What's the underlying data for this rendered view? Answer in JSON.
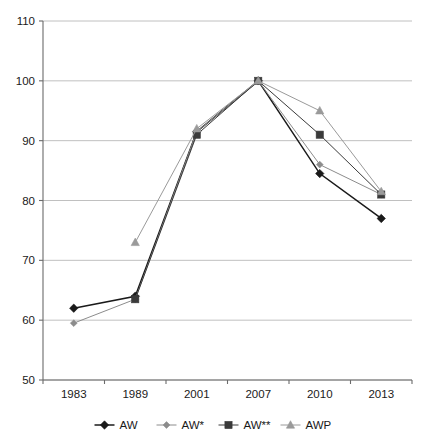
{
  "chart_data": {
    "type": "line",
    "title": "",
    "subtitle": "",
    "xlabel": "",
    "ylabel": "",
    "categories": [
      "1983",
      "1989",
      "2001",
      "2007",
      "2010",
      "2013"
    ],
    "ylim": [
      50,
      110
    ],
    "yticks": [
      50,
      60,
      70,
      80,
      90,
      100,
      110
    ],
    "grid": true,
    "legend_position": "bottom",
    "series": [
      {
        "name": "AW",
        "marker": "filled-diamond",
        "color": "#1a1a1a",
        "x": [
          "1983",
          "1989",
          "2001",
          "2007",
          "2010",
          "2013"
        ],
        "values": [
          62,
          64,
          91.5,
          100,
          84.5,
          77
        ]
      },
      {
        "name": "AW*",
        "marker": "small-diamond",
        "color": "#8c8c8c",
        "x": [
          "1983",
          "1989",
          "2001",
          "2007",
          "2010",
          "2013"
        ],
        "values": [
          59.5,
          63.5,
          91.5,
          100,
          86,
          81
        ]
      },
      {
        "name": "AW**",
        "marker": "square",
        "color": "#3a3a3a",
        "x": [
          "1989",
          "2001",
          "2007",
          "2010",
          "2013"
        ],
        "values": [
          63.5,
          91,
          100,
          91,
          81
        ]
      },
      {
        "name": "AWP",
        "marker": "triangle",
        "color": "#9a9a9a",
        "x": [
          "1989",
          "2001",
          "2007",
          "2010",
          "2013"
        ],
        "values": [
          73,
          92,
          100,
          95,
          81.5
        ]
      }
    ]
  },
  "axes": {
    "y_tick_labels": [
      "110",
      "100",
      "90",
      "80",
      "70",
      "60",
      "50"
    ],
    "x_tick_labels": [
      "1983",
      "1989",
      "2001",
      "2007",
      "2010",
      "2013"
    ]
  },
  "legend": {
    "entries": [
      {
        "label": "AW",
        "marker": "filled-diamond",
        "color": "#1a1a1a"
      },
      {
        "label": "AW*",
        "marker": "small-diamond",
        "color": "#8c8c8c"
      },
      {
        "label": "AW**",
        "marker": "square",
        "color": "#3a3a3a"
      },
      {
        "label": "AWP",
        "marker": "triangle",
        "color": "#9a9a9a"
      }
    ]
  },
  "colors": {
    "grid": "#b9b9b9",
    "axis": "#6b6b6b",
    "text": "#1a1a1a",
    "background": "#ffffff"
  }
}
